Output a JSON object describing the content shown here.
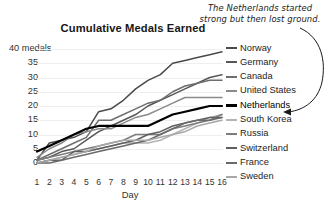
{
  "chart_data": {
    "type": "line",
    "title": "Cumulative Medals Earned",
    "xlabel": "Day",
    "ylabel": "medals",
    "y_axis_top_label": "40 medals",
    "x": [
      1,
      2,
      3,
      4,
      5,
      6,
      7,
      8,
      9,
      10,
      11,
      12,
      13,
      14,
      15,
      16
    ],
    "xlim": [
      1,
      16
    ],
    "ylim": [
      0,
      40
    ],
    "yticks": [
      0,
      5,
      10,
      15,
      20,
      25,
      30,
      35,
      40
    ],
    "ytick_labels": [
      "0",
      "5",
      "10",
      "15",
      "20",
      "25",
      "30",
      "35",
      "40 medals"
    ],
    "xtick_labels": [
      "1",
      "2",
      "3",
      "4",
      "5",
      "6",
      "7",
      "8",
      "9",
      "10",
      "11",
      "12",
      "13",
      "14",
      "15",
      "16"
    ],
    "grid": true,
    "legend_position": "right",
    "annotation": "The Netherlands started strong but then lost ground.",
    "annotation_target": "Netherlands",
    "series": [
      {
        "name": "Norway",
        "color": "#4a4a4a",
        "width": 1.5,
        "values": [
          1,
          7,
          8,
          9,
          11,
          18,
          19,
          22,
          26,
          29,
          31,
          35,
          36,
          37,
          38,
          39
        ]
      },
      {
        "name": "Germany",
        "color": "#575757",
        "width": 1.5,
        "values": [
          1,
          2,
          4,
          5,
          8,
          11,
          13,
          15,
          17,
          20,
          22,
          24,
          26,
          28,
          30,
          31
        ]
      },
      {
        "name": "Canada",
        "color": "#6e6e6e",
        "width": 1.5,
        "values": [
          1,
          3,
          5,
          7,
          9,
          15,
          15,
          17,
          19,
          21,
          22,
          25,
          27,
          28,
          29,
          29
        ]
      },
      {
        "name": "United States",
        "color": "#8a8a8a",
        "width": 1.5,
        "values": [
          2,
          5,
          7,
          10,
          11,
          12,
          12,
          14,
          16,
          17,
          19,
          21,
          23,
          23,
          23,
          23
        ]
      },
      {
        "name": "Netherlands",
        "color": "#000000",
        "width": 2.2,
        "values": [
          4,
          6,
          8,
          10,
          12,
          13,
          13,
          13,
          13,
          13,
          15,
          17,
          18,
          19,
          20,
          20
        ]
      },
      {
        "name": "South Korea",
        "color": "#b4b4b4",
        "width": 1.5,
        "values": [
          0,
          1,
          2,
          3,
          4,
          5,
          6,
          7,
          7,
          7,
          8,
          10,
          12,
          14,
          16,
          17
        ]
      },
      {
        "name": "Russia",
        "color": "#7d7d7d",
        "width": 1.5,
        "values": [
          1,
          2,
          3,
          4,
          5,
          6,
          7,
          8,
          10,
          10,
          10,
          12,
          13,
          14,
          15,
          17
        ]
      },
      {
        "name": "Switzerland",
        "color": "#5f5f5f",
        "width": 1.5,
        "values": [
          0,
          1,
          1,
          4,
          4,
          5,
          6,
          7,
          8,
          10,
          11,
          13,
          14,
          15,
          16,
          16
        ]
      },
      {
        "name": "France",
        "color": "#6a6a6a",
        "width": 1.5,
        "values": [
          0,
          0,
          1,
          2,
          3,
          4,
          5,
          6,
          7,
          8,
          10,
          12,
          14,
          15,
          15,
          16
        ]
      },
      {
        "name": "Sweden",
        "color": "#a8a8a8",
        "width": 1.5,
        "values": [
          0,
          1,
          2,
          3,
          4,
          6,
          7,
          8,
          8,
          8,
          9,
          10,
          11,
          13,
          14,
          15
        ]
      }
    ]
  }
}
